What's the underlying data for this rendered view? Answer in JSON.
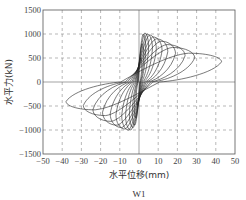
{
  "chart_data": {
    "type": "line",
    "title": "",
    "caption": "W1",
    "xlabel": "水平位移(mm)",
    "ylabel": "水平力(kN)",
    "xlim": [
      -50,
      50
    ],
    "ylim": [
      -1500,
      1500
    ],
    "x_ticks": [
      -50,
      -40,
      -30,
      -20,
      -10,
      0,
      10,
      20,
      30,
      40,
      50
    ],
    "y_ticks": [
      -1500,
      -1000,
      -500,
      0,
      500,
      1000,
      1500
    ],
    "x_tick_labels": [
      "−50",
      "−40",
      "−30",
      "−20",
      "−10",
      "0",
      "10",
      "20",
      "30",
      "40",
      "50"
    ],
    "y_tick_labels": [
      "−1500",
      "−1000",
      "−500",
      "0",
      "500",
      "1000",
      "1500"
    ],
    "grid": {
      "x": "dashed",
      "y": "dashed",
      "zero_lines": "solid"
    },
    "legend": null,
    "loops": [
      {
        "pos_disp": 1.5,
        "pos_peak": 500,
        "neg_disp": -1.5,
        "neg_peak": -480
      },
      {
        "pos_disp": 2.5,
        "pos_peak": 800,
        "neg_disp": -2.5,
        "neg_peak": -750
      },
      {
        "pos_disp": 3.5,
        "pos_peak": 1000,
        "neg_disp": -3.5,
        "neg_peak": -900
      },
      {
        "pos_disp": 5,
        "pos_peak": 1020,
        "neg_disp": -5,
        "neg_peak": -950
      },
      {
        "pos_disp": 7,
        "pos_peak": 1000,
        "neg_disp": -7,
        "neg_peak": -1000
      },
      {
        "pos_disp": 9,
        "pos_peak": 980,
        "neg_disp": -9,
        "neg_peak": -1000
      },
      {
        "pos_disp": 12,
        "pos_peak": 940,
        "neg_disp": -12,
        "neg_peak": -980
      },
      {
        "pos_disp": 15,
        "pos_peak": 900,
        "neg_disp": -15,
        "neg_peak": -950
      },
      {
        "pos_disp": 19,
        "pos_peak": 850,
        "neg_disp": -19,
        "neg_peak": -900
      },
      {
        "pos_disp": 24,
        "pos_peak": 780,
        "neg_disp": -24,
        "neg_peak": -820
      },
      {
        "pos_disp": 29,
        "pos_peak": 720,
        "neg_disp": -29,
        "neg_peak": -700
      },
      {
        "pos_disp": 43,
        "pos_peak": 600,
        "neg_disp": -38,
        "neg_peak": -580
      }
    ]
  }
}
